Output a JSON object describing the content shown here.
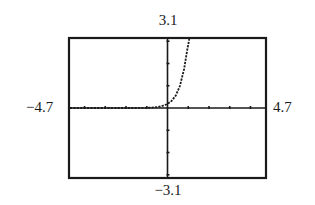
{
  "chart_data": {
    "type": "line",
    "title": "",
    "xlabel": "",
    "ylabel": "",
    "xlim": [
      -4.7,
      4.7
    ],
    "ylim": [
      -3.1,
      3.1
    ],
    "x_tick_step": 1,
    "y_tick_step": 1,
    "grid": false,
    "window_labels": {
      "ymax": "3.1",
      "ymin": "−3.1",
      "xmin": "−4.7",
      "xmax": "4.7"
    },
    "series": [
      {
        "name": "curve",
        "style": "dotted",
        "x": [
          -4.7,
          -3,
          -2,
          -1.5,
          -1,
          -0.75,
          -0.5,
          -0.25,
          0,
          0.2,
          0.4,
          0.6,
          0.8,
          0.95,
          1.05
        ],
        "y": [
          0.0,
          0.0,
          0.0,
          0.0,
          0.01,
          0.02,
          0.04,
          0.09,
          0.18,
          0.32,
          0.56,
          0.99,
          1.75,
          2.6,
          3.1
        ]
      }
    ]
  },
  "colors": {
    "frame": "#1a1a1a",
    "axes": "#1a1a1a",
    "curve": "#1a1a1a",
    "background": "#ffffff"
  }
}
